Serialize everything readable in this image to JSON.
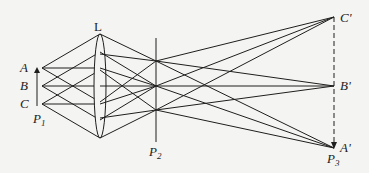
{
  "diagram": {
    "type": "optics-ray-diagram",
    "labels": {
      "lens": "L",
      "object_points": [
        "A",
        "B",
        "C"
      ],
      "image_points": [
        "C'",
        "B'",
        "A'"
      ],
      "planes": {
        "p1": {
          "main": "P",
          "sub": "1"
        },
        "p2": {
          "main": "P",
          "sub": "2"
        },
        "p3": {
          "main": "P",
          "sub": "3"
        }
      }
    },
    "nodes": {
      "A": [
        42,
        68
      ],
      "B": [
        42,
        86
      ],
      "C": [
        42,
        104
      ],
      "lens_top": [
        100,
        34
      ],
      "lens_bottom": [
        100,
        138
      ],
      "F_top": [
        156,
        61
      ],
      "F_mid": [
        156,
        86
      ],
      "F_bot": [
        156,
        110
      ],
      "C_prime": [
        334,
        17
      ],
      "B_prime": [
        334,
        86
      ],
      "A_prime": [
        334,
        148
      ]
    },
    "colors": {
      "line": "#1e1e1e",
      "background": "#f4f4f2"
    }
  }
}
